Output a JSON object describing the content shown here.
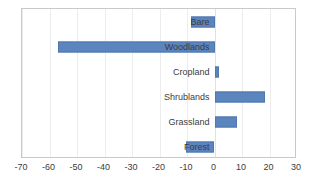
{
  "chart_data": {
    "type": "bar",
    "orientation": "horizontal",
    "title": "",
    "subtitle": "",
    "xlabel": "",
    "ylabel": "",
    "xlim": [
      -70,
      30
    ],
    "ylim": null,
    "grid": true,
    "legend": false,
    "legend_position": "none",
    "xticks": [
      -70,
      -60,
      -50,
      -40,
      -30,
      -20,
      -10,
      0,
      10,
      20,
      30
    ],
    "xtick_labels": [
      "-70",
      "-60",
      "-50",
      "-40",
      "-30",
      "-20",
      "-10",
      "0",
      "10",
      "20",
      "30"
    ],
    "categories": [
      "Bare",
      "Woodlands",
      "Cropland",
      "Shrublands",
      "Grassland",
      "Forest"
    ],
    "values": [
      -8.5,
      -57,
      1.5,
      18.4,
      8.2,
      -10.4
    ],
    "series": [
      {
        "name": "",
        "color": "#5c84bd",
        "values": [
          -8.5,
          -57,
          1.5,
          18.4,
          8.2,
          -10.4
        ]
      }
    ],
    "annotations": []
  },
  "style": {
    "bar_color": "#5c84bd",
    "bar_border_color": "#4f78b0",
    "plot_border_color": "#c9c9c9",
    "gridline_color": "#ededed",
    "text_color": "#3c3c3c",
    "background": "#ffffff"
  }
}
